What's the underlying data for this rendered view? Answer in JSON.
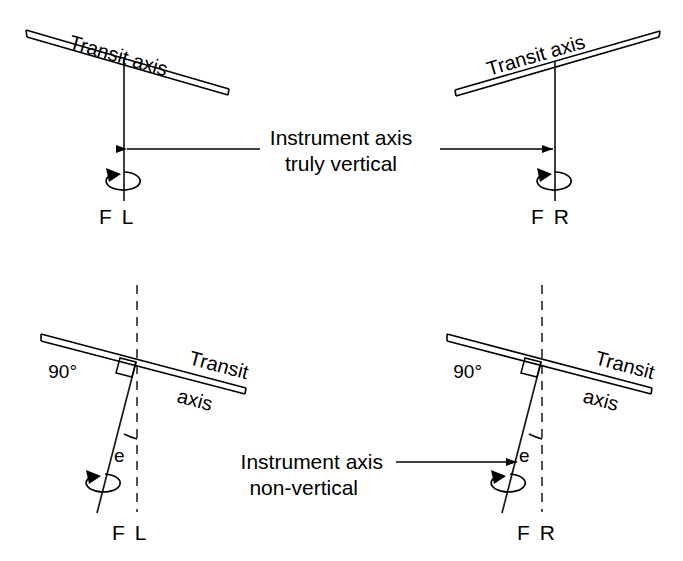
{
  "figure": {
    "background_color": "#ffffff",
    "line_color": "#000000"
  },
  "panels": {
    "top_left": {
      "transit_axis_label": "Transit axis",
      "station_label": "F L",
      "rotation_icon": "rotation-arrow-icon",
      "axis_state": "vertical"
    },
    "top_right": {
      "transit_axis_label": "Transit axis",
      "station_label": "F R",
      "rotation_icon": "rotation-arrow-icon",
      "axis_state": "vertical"
    },
    "bottom_left": {
      "transit_axis_label_line1": "Transit",
      "transit_axis_label_line2": "axis",
      "right_angle_label": "90°",
      "error_angle_label": "e",
      "station_label": "F L",
      "rotation_icon": "rotation-arrow-icon",
      "axis_state": "non-vertical"
    },
    "bottom_right": {
      "transit_axis_label_line1": "Transit",
      "transit_axis_label_line2": "axis",
      "right_angle_label": "90°",
      "error_angle_label": "e",
      "station_label": "F R",
      "rotation_icon": "rotation-arrow-icon",
      "axis_state": "non-vertical"
    }
  },
  "callouts": {
    "top": {
      "line1": "Instrument axis",
      "line2": "truly vertical",
      "left_arrow": "arrow-left-icon",
      "right_arrow": "arrow-right-icon"
    },
    "bottom": {
      "line1": "Instrument axis",
      "line2": "non-vertical",
      "right_arrow": "arrow-right-icon"
    }
  }
}
